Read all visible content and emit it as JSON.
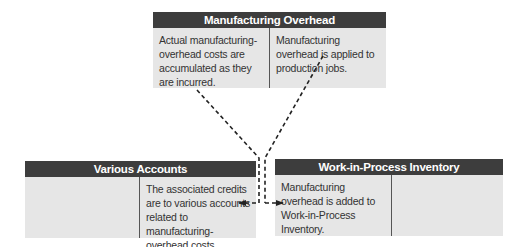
{
  "accounts": {
    "manufacturing_overhead": {
      "title": "Manufacturing Overhead",
      "debit_text": "Actual manufacturing-overhead costs are accumulated as they are incurred.",
      "credit_text": "Manufacturing overhead is applied to production jobs."
    },
    "various_accounts": {
      "title": "Various Accounts",
      "debit_text": "",
      "credit_text": "The associated credits are to various accounts related to manufacturing-overhead costs."
    },
    "work_in_process": {
      "title": "Work-in-Process Inventory",
      "debit_text": "Manufacturing overhead is added to Work-in-Process Inventory.",
      "credit_text": ""
    }
  },
  "colors": {
    "header_bg": "#3d3d3d",
    "body_bg": "#e6e6e6",
    "arrow": "#222222"
  }
}
